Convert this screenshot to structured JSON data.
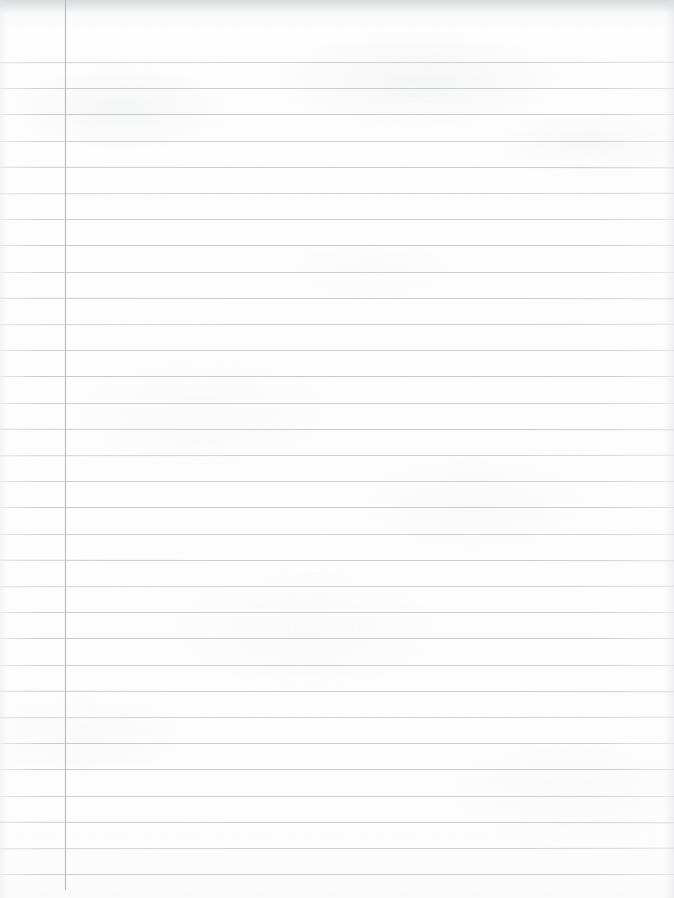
{
  "document": {
    "type": "blank-lined-notebook-page",
    "title": "Blank Lined Notebook Page",
    "page_width": 674,
    "page_height": 898,
    "background_color": "#fdfdfd",
    "content_text": "",
    "has_handwriting": false,
    "has_printed_text": false
  },
  "paper": {
    "kind": "ruled-writing-paper",
    "paper_color": "#fdfdfd",
    "scan_top_shadow_color": "#c4c6c9",
    "texture": "faint mottled scan grain"
  },
  "ruling": {
    "line_color": "#c6c9cc",
    "line_thickness_px": 1,
    "first_line_y": 62,
    "line_spacing_px": 26.2,
    "line_count": 32,
    "line_left_x": 0,
    "line_right_x": 674,
    "lines_y": [
      62.0,
      88.2,
      114.4,
      140.6,
      166.8,
      193.0,
      219.2,
      245.4,
      271.6,
      297.8,
      324.0,
      350.2,
      376.4,
      402.6,
      428.8,
      455.0,
      481.2,
      507.4,
      533.6,
      559.8,
      586.0,
      612.2,
      638.4,
      664.6,
      690.8,
      717.0,
      743.2,
      769.4,
      795.6,
      821.8,
      848.0,
      874.2
    ]
  },
  "margin_rule": {
    "label": "left-margin-rule",
    "color": "#b9bcc0",
    "x": 65,
    "thickness_px": 1,
    "top_y": 0,
    "bottom_y": 890
  },
  "regions": {
    "header_area_label": "top blank header band above first rule",
    "margin_column_label": "narrow left margin column",
    "writing_area_label": "main ruled writing area"
  }
}
